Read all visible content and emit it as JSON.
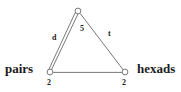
{
  "diagram": {
    "type": "graph-triangle",
    "background_color": "#ffffff",
    "stroke_color": "#555555",
    "text_color": "#1c1c1c",
    "nodes": [
      {
        "id": "apex",
        "label": "",
        "weight": "",
        "x": 78,
        "y": 11,
        "radius": 3
      },
      {
        "id": "pairs",
        "label": "pairs",
        "weight": "2",
        "x": 50,
        "y": 72,
        "radius": 3
      },
      {
        "id": "hexads",
        "label": "hexads",
        "weight": "2",
        "x": 125,
        "y": 72,
        "radius": 3
      }
    ],
    "edges": [
      {
        "id": "edge-left",
        "from": "apex",
        "to": "pairs",
        "label": "d",
        "multiplicity": 2,
        "style": "double-line"
      },
      {
        "id": "edge-middle",
        "from": "apex",
        "to": "pairs",
        "label": "5",
        "multiplicity": 1,
        "style": "single-line"
      },
      {
        "id": "edge-right",
        "from": "apex",
        "to": "hexads",
        "label": "t",
        "multiplicity": 1,
        "style": "single-line"
      },
      {
        "id": "edge-bottom",
        "from": "pairs",
        "to": "hexads",
        "label": "",
        "multiplicity": 1,
        "style": "single-line"
      }
    ]
  },
  "labels": {
    "node_left": "pairs",
    "node_right": "hexads",
    "edge_left": "d",
    "edge_middle": "5",
    "edge_right": "t",
    "weight_left": "2",
    "weight_right": "2"
  }
}
